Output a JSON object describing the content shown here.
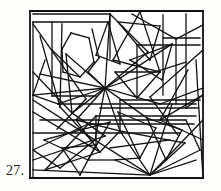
{
  "page": {
    "background_color": "#fdfdfc",
    "width": 221,
    "height": 191
  },
  "figure": {
    "label": "27.",
    "label_color": "#1a1a1a",
    "kind": "line-tangle-puzzle",
    "stroke_color": "#111111",
    "stroke_width": 1.3,
    "fill_color": "#ffffff",
    "frame": {
      "x": 30,
      "y": 11,
      "width": 173,
      "height": 167,
      "stroke_width": 1.8
    },
    "viewbox": "0 0 221 191",
    "segments": [
      [
        30,
        11,
        203,
        11
      ],
      [
        203,
        11,
        203,
        178
      ],
      [
        203,
        178,
        30,
        178
      ],
      [
        30,
        178,
        30,
        11
      ],
      [
        33,
        14,
        110,
        14
      ],
      [
        110,
        14,
        110,
        58
      ],
      [
        33,
        22,
        108,
        22
      ],
      [
        33,
        22,
        33,
        95
      ],
      [
        52,
        22,
        52,
        96
      ],
      [
        52,
        96,
        96,
        96
      ],
      [
        33,
        24,
        86,
        99
      ],
      [
        86,
        99,
        57,
        129
      ],
      [
        62,
        24,
        60,
        107
      ],
      [
        60,
        107,
        92,
        141
      ],
      [
        71,
        33,
        89,
        38
      ],
      [
        89,
        38,
        94,
        62
      ],
      [
        94,
        62,
        80,
        77
      ],
      [
        80,
        77,
        63,
        72
      ],
      [
        63,
        72,
        62,
        49
      ],
      [
        62,
        49,
        71,
        33
      ],
      [
        66,
        54,
        105,
        88
      ],
      [
        105,
        88,
        72,
        113
      ],
      [
        72,
        113,
        66,
        54
      ],
      [
        92,
        29,
        99,
        58
      ],
      [
        99,
        58,
        88,
        72
      ],
      [
        88,
        72,
        105,
        88
      ],
      [
        110,
        14,
        148,
        52
      ],
      [
        148,
        52,
        105,
        88
      ],
      [
        105,
        88,
        110,
        14
      ],
      [
        118,
        22,
        160,
        26
      ],
      [
        160,
        26,
        150,
        60
      ],
      [
        150,
        60,
        118,
        22
      ],
      [
        132,
        14,
        176,
        39
      ],
      [
        176,
        39,
        203,
        25
      ],
      [
        140,
        12,
        113,
        60
      ],
      [
        113,
        60,
        160,
        72
      ],
      [
        160,
        72,
        140,
        12
      ],
      [
        163,
        15,
        163,
        95
      ],
      [
        163,
        38,
        200,
        38
      ],
      [
        176,
        39,
        176,
        104
      ],
      [
        137,
        45,
        200,
        45
      ],
      [
        137,
        45,
        137,
        98
      ],
      [
        105,
        88,
        172,
        44
      ],
      [
        105,
        88,
        186,
        62
      ],
      [
        105,
        88,
        160,
        104
      ],
      [
        105,
        88,
        147,
        118
      ],
      [
        105,
        88,
        120,
        131
      ],
      [
        105,
        88,
        95,
        140
      ],
      [
        105,
        88,
        76,
        120
      ],
      [
        105,
        88,
        58,
        104
      ],
      [
        105,
        88,
        33,
        95
      ],
      [
        105,
        88,
        40,
        74
      ],
      [
        186,
        14,
        186,
        108
      ],
      [
        203,
        50,
        150,
        97
      ],
      [
        150,
        97,
        178,
        135
      ],
      [
        203,
        95,
        160,
        120
      ],
      [
        160,
        120,
        203,
        140
      ],
      [
        120,
        100,
        200,
        100
      ],
      [
        120,
        100,
        120,
        131
      ],
      [
        100,
        108,
        198,
        108
      ],
      [
        96,
        116,
        196,
        116
      ],
      [
        96,
        116,
        96,
        145
      ],
      [
        88,
        124,
        194,
        124
      ],
      [
        58,
        104,
        196,
        104
      ],
      [
        40,
        120,
        186,
        120
      ],
      [
        33,
        133,
        180,
        133
      ],
      [
        33,
        95,
        33,
        178
      ],
      [
        33,
        100,
        95,
        140
      ],
      [
        95,
        140,
        60,
        168
      ],
      [
        60,
        168,
        33,
        150
      ],
      [
        33,
        112,
        100,
        152
      ],
      [
        100,
        152,
        45,
        170
      ],
      [
        33,
        160,
        105,
        136
      ],
      [
        105,
        136,
        72,
        113
      ],
      [
        44,
        140,
        110,
        122
      ],
      [
        110,
        122,
        88,
        160
      ],
      [
        88,
        160,
        44,
        140
      ],
      [
        62,
        148,
        96,
        145
      ],
      [
        96,
        145,
        80,
        175
      ],
      [
        80,
        175,
        62,
        148
      ],
      [
        76,
        120,
        120,
        131
      ],
      [
        120,
        131,
        100,
        152
      ],
      [
        100,
        152,
        76,
        120
      ],
      [
        118,
        112,
        156,
        128
      ],
      [
        156,
        128,
        140,
        158
      ],
      [
        140,
        158,
        118,
        112
      ],
      [
        147,
        118,
        182,
        130
      ],
      [
        182,
        130,
        166,
        160
      ],
      [
        166,
        160,
        147,
        118
      ],
      [
        120,
        131,
        150,
        175
      ],
      [
        150,
        175,
        185,
        143
      ],
      [
        185,
        143,
        120,
        131
      ],
      [
        95,
        140,
        150,
        175
      ],
      [
        150,
        175,
        200,
        150
      ],
      [
        200,
        150,
        186,
        120
      ],
      [
        150,
        175,
        196,
        160
      ],
      [
        150,
        175,
        115,
        160
      ],
      [
        150,
        175,
        33,
        170
      ],
      [
        150,
        175,
        203,
        120
      ],
      [
        150,
        175,
        172,
        104
      ],
      [
        196,
        60,
        203,
        178
      ],
      [
        186,
        108,
        203,
        95
      ],
      [
        160,
        104,
        203,
        88
      ],
      [
        188,
        70,
        160,
        120
      ],
      [
        33,
        72,
        72,
        113
      ],
      [
        45,
        60,
        33,
        95
      ],
      [
        52,
        50,
        80,
        77
      ],
      [
        40,
        36,
        60,
        107
      ],
      [
        108,
        22,
        96,
        55
      ],
      [
        96,
        55,
        120,
        64
      ],
      [
        120,
        64,
        108,
        22
      ],
      [
        130,
        60,
        172,
        44
      ],
      [
        172,
        44,
        162,
        80
      ],
      [
        162,
        80,
        130,
        60
      ],
      [
        115,
        72,
        160,
        72
      ],
      [
        160,
        72,
        137,
        98
      ],
      [
        137,
        98,
        115,
        72
      ],
      [
        33,
        95,
        58,
        104
      ],
      [
        33,
        150,
        88,
        124
      ],
      [
        45,
        170,
        96,
        116
      ],
      [
        115,
        160,
        88,
        160
      ],
      [
        115,
        160,
        140,
        158
      ],
      [
        110,
        148,
        170,
        140
      ]
    ]
  }
}
